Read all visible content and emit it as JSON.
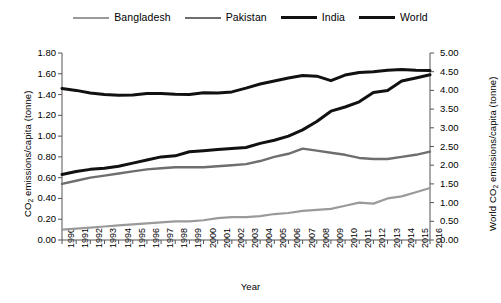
{
  "chart_data": {
    "type": "line",
    "title": "",
    "xlabel": "Year",
    "ylabel": "CO2 emissions/capita (tonne)",
    "ylabel_right": "World CO2 emissions/capita (tonne)",
    "x": [
      1990,
      1991,
      1992,
      1993,
      1994,
      1995,
      1996,
      1997,
      1998,
      1999,
      2000,
      2001,
      2002,
      2003,
      2004,
      2005,
      2006,
      2007,
      2008,
      2009,
      2010,
      2011,
      2012,
      2013,
      2014,
      2015,
      2016
    ],
    "xlim": [
      1990,
      2016
    ],
    "ylim": [
      0.0,
      1.8
    ],
    "ylim_right": [
      0.0,
      5.0
    ],
    "yticks": [
      "0.00",
      "0.20",
      "0.40",
      "0.60",
      "0.80",
      "1.00",
      "1.20",
      "1.40",
      "1.60",
      "1.80"
    ],
    "yticks_right": [
      "0.00",
      "0.50",
      "1.00",
      "1.50",
      "2.00",
      "2.50",
      "3.00",
      "3.50",
      "4.00",
      "4.50",
      "5.00"
    ],
    "grid": false,
    "legend_position": "top",
    "series": [
      {
        "name": "Bangladesh",
        "axis": "left",
        "color": "#9a9a9a",
        "width": 2.2,
        "values": [
          0.1,
          0.11,
          0.12,
          0.13,
          0.14,
          0.15,
          0.16,
          0.17,
          0.18,
          0.18,
          0.19,
          0.21,
          0.22,
          0.22,
          0.23,
          0.25,
          0.26,
          0.28,
          0.29,
          0.3,
          0.33,
          0.36,
          0.35,
          0.4,
          0.42,
          0.46,
          0.5
        ]
      },
      {
        "name": "Pakistan",
        "axis": "left",
        "color": "#6e6e6e",
        "width": 2.4,
        "values": [
          0.54,
          0.57,
          0.6,
          0.62,
          0.64,
          0.66,
          0.68,
          0.69,
          0.7,
          0.7,
          0.7,
          0.71,
          0.72,
          0.73,
          0.76,
          0.8,
          0.83,
          0.88,
          0.86,
          0.84,
          0.82,
          0.79,
          0.78,
          0.78,
          0.8,
          0.82,
          0.85
        ]
      },
      {
        "name": "India",
        "axis": "left",
        "color": "#111111",
        "width": 3.0,
        "values": [
          0.63,
          0.66,
          0.68,
          0.69,
          0.71,
          0.74,
          0.77,
          0.8,
          0.81,
          0.85,
          0.86,
          0.87,
          0.88,
          0.89,
          0.93,
          0.96,
          1.0,
          1.06,
          1.14,
          1.24,
          1.28,
          1.33,
          1.42,
          1.44,
          1.53,
          1.56,
          1.59
        ]
      },
      {
        "name": "World",
        "axis": "right",
        "color": "#111111",
        "width": 3.0,
        "values": [
          4.05,
          4.0,
          3.93,
          3.89,
          3.87,
          3.88,
          3.92,
          3.92,
          3.9,
          3.89,
          3.94,
          3.93,
          3.96,
          4.06,
          4.17,
          4.25,
          4.33,
          4.4,
          4.38,
          4.26,
          4.41,
          4.48,
          4.5,
          4.54,
          4.56,
          4.54,
          4.53
        ]
      }
    ]
  },
  "legend": {
    "items": [
      {
        "label": "Bangladesh"
      },
      {
        "label": "Pakistan"
      },
      {
        "label": "India"
      },
      {
        "label": "World"
      }
    ]
  },
  "axes": {
    "x_title": "Year",
    "y_left_prefix": "CO",
    "y_left_sub": "2",
    "y_left_suffix": " emissions/capita (tonne)",
    "y_right_prefix": "World CO",
    "y_right_sub": "2",
    "y_right_suffix": " emissions/capita (tonne)"
  }
}
